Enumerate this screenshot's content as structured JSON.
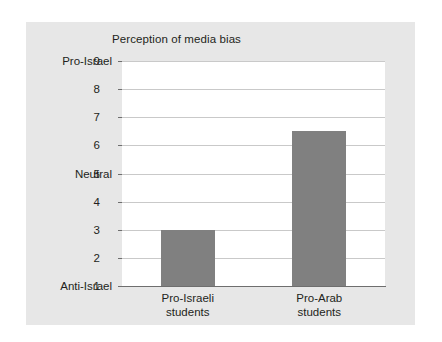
{
  "chart_data": {
    "type": "bar",
    "title": "Perception of media bias",
    "xlabel": "",
    "ylabel": "",
    "categories": [
      "Pro-Israeli students",
      "Pro-Arab students"
    ],
    "category_lines": [
      [
        "Pro-Israeli",
        "students"
      ],
      [
        "Pro-Arab",
        "students"
      ]
    ],
    "values": [
      3.0,
      6.5
    ],
    "ylim": [
      1,
      9
    ],
    "yticks": [
      1,
      2,
      3,
      4,
      5,
      6,
      7,
      8,
      9
    ],
    "ytick_labels": [
      "1",
      "2",
      "3",
      "4",
      "5",
      "6",
      "7",
      "8",
      "9"
    ],
    "axis_anchors": [
      {
        "value": 9,
        "label": "Pro-Israel"
      },
      {
        "value": 5,
        "label": "Neutral"
      },
      {
        "value": 1,
        "label": "Anti-Israel"
      }
    ],
    "grid": true,
    "legend": null,
    "colors": {
      "bar": "#808080",
      "panel": "#e7e7e7",
      "plot_background": "#ffffff",
      "gridline": "#c9c9c9",
      "axis": "#6e6e6e",
      "text": "#231f20"
    }
  }
}
